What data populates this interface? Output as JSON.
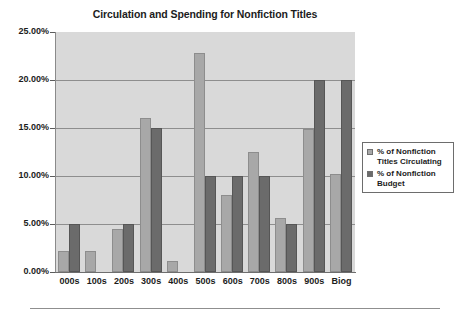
{
  "chart_data": {
    "type": "bar",
    "title": "Circulation and Spending for Nonfiction Titles",
    "xlabel": "",
    "ylabel": "",
    "ylim": [
      0,
      25
    ],
    "ytick_labels": [
      "25.00%",
      "20.00%",
      "15.00%",
      "10.00%",
      "5.00%",
      "0.00%"
    ],
    "ytick_values": [
      25,
      20,
      15,
      10,
      5,
      0
    ],
    "grid": true,
    "legend_position": "right",
    "categories": [
      "000s",
      "100s",
      "200s",
      "300s",
      "400s",
      "500s",
      "600s",
      "700s",
      "800s",
      "900s",
      "Biog"
    ],
    "series": [
      {
        "name": "% of Nonfiction Titles Circulating",
        "color": "#a8a8a8",
        "values": [
          2.2,
          2.2,
          4.5,
          16.0,
          1.1,
          22.8,
          8.0,
          12.5,
          5.6,
          14.9,
          10.2
        ]
      },
      {
        "name": "% of Nonfiction Budget",
        "color": "#6b6b6b",
        "values": [
          5.0,
          0,
          5.0,
          15.0,
          0,
          10.0,
          10.0,
          10.0,
          5.0,
          20.0,
          20.0
        ]
      }
    ]
  },
  "legend": {
    "entries": [
      {
        "label_line1": "% of Nonfiction",
        "label_line2": "Titles Circulating"
      },
      {
        "label_line1": "% of Nonfiction",
        "label_line2": "Budget"
      }
    ]
  }
}
